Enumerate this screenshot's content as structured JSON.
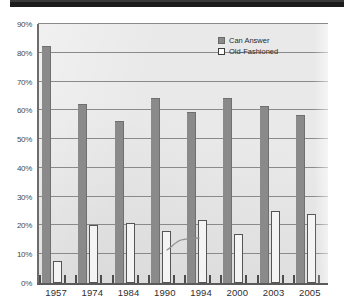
{
  "chart_data": {
    "type": "bar",
    "title": "",
    "subtitle": "",
    "xlabel": "",
    "ylabel": "",
    "categories": [
      "1957",
      "1974",
      "1984",
      "1990",
      "1994",
      "2000",
      "2003",
      "2005"
    ],
    "series": [
      {
        "name": "Can Answer",
        "values": [
          82,
          62,
          56,
          64,
          59,
          64,
          61,
          58
        ]
      },
      {
        "name": "Old-Fashioned",
        "values": [
          7.5,
          20,
          21,
          18,
          22,
          17,
          25,
          24
        ]
      }
    ],
    "ylim": [
      0,
      90
    ],
    "y_ticks": [
      "0%",
      "10%",
      "20%",
      "30%",
      "40%",
      "50%",
      "60%",
      "70%",
      "80%",
      "90%"
    ],
    "y_tick_values": [
      0,
      10,
      20,
      30,
      40,
      50,
      60,
      70,
      80,
      90
    ],
    "grid": true,
    "legend_position": "top-right",
    "colors": {
      "can_answer": "#8a8a8a",
      "old_fashioned": "#f4f4f4",
      "old_fashioned_border": "#555555",
      "plot_background": "#e2e2e2",
      "axis": "#5a5a5a",
      "gridline": "#8a8a8a",
      "top_band": "#1c1c1c"
    }
  },
  "legend": {
    "items": [
      {
        "label": "Can Answer",
        "swatch": "filled-square"
      },
      {
        "label": "Old-Fashioned",
        "swatch": "outline-square"
      }
    ]
  }
}
